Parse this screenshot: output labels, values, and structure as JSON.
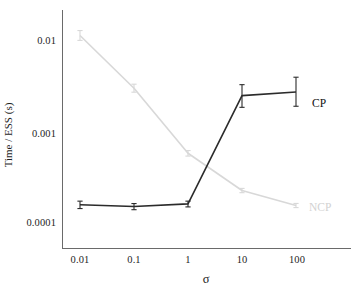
{
  "chart_data": {
    "type": "line",
    "title": "",
    "xlabel": "σ",
    "ylabel": "Time / ESS (s)",
    "xscale": "log",
    "yscale": "log",
    "grid": false,
    "legend_position": "inline-right",
    "x": [
      0.01,
      0.1,
      1,
      10,
      100
    ],
    "xtick_labels": [
      "0.01",
      "0.1",
      "1",
      "10",
      "100"
    ],
    "ytick_labels": [
      "0.01",
      "0.001",
      "0.0001"
    ],
    "ytick_values": [
      0.01,
      0.001,
      0.0001
    ],
    "ylim": [
      6e-05,
      0.02
    ],
    "xlim": [
      0.004,
      300
    ],
    "series": [
      {
        "name": "CP",
        "color": "#2b2b2b",
        "values": [
          0.000155,
          0.000148,
          0.000158,
          0.00245,
          0.00268
        ],
        "err_low": [
          1.45e-05,
          1.15e-05,
          1.15e-05,
          0.00063,
          0.00081
        ],
        "err_high": [
          1.45e-05,
          1.15e-05,
          1.15e-05,
          0.00078,
          0.00122
        ]
      },
      {
        "name": "NCP",
        "color": "#d8d8d8",
        "values": [
          0.0112,
          0.00295,
          0.00057,
          0.000222,
          0.000152
        ],
        "err_low": [
          0.0013,
          0.00028,
          4e-05,
          1.2e-05,
          8e-06
        ],
        "err_high": [
          0.0015,
          0.00032,
          4e-05,
          1.2e-05,
          8e-06
        ]
      }
    ],
    "annotations": [
      {
        "text": "CP",
        "x": 180,
        "y": 100,
        "color": "#111111"
      },
      {
        "text": "NCP",
        "x": 215,
        "y": 205,
        "color": "#d2d2d2"
      }
    ]
  },
  "axes": {
    "y_label": "Time / ESS (s)",
    "x_label": "σ",
    "y_ticks": [
      {
        "label": "0.01"
      },
      {
        "label": "0.001"
      },
      {
        "label": "0.0001"
      }
    ],
    "x_ticks": [
      {
        "label": "0.01"
      },
      {
        "label": "0.1"
      },
      {
        "label": "1"
      },
      {
        "label": "10"
      },
      {
        "label": "100"
      }
    ]
  },
  "legend": {
    "cp": "CP",
    "ncp": "NCP"
  }
}
